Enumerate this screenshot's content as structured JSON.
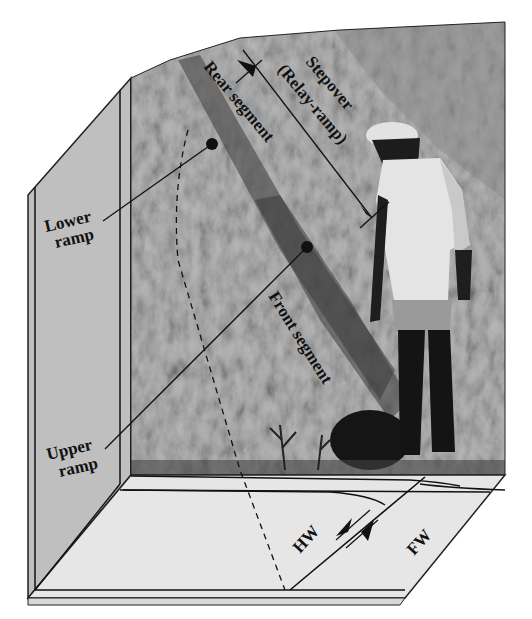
{
  "figure": {
    "labels": {
      "stepover_line1": "Stepover",
      "stepover_line2": "(Relay-ramp)",
      "rear_segment": "Rear segment",
      "front_segment": "Front segment",
      "lower_ramp_line1": "Lower",
      "lower_ramp_line2": "ramp",
      "upper_ramp_line1": "Upper",
      "upper_ramp_line2": "ramp",
      "hanging_wall": "HW",
      "foot_wall": "FW"
    },
    "colors": {
      "background": "#ffffff",
      "side_wall": "#bdbdbd",
      "floor": "#e6e6e6",
      "rock": "#a8a8a8",
      "line": "#111111"
    }
  }
}
